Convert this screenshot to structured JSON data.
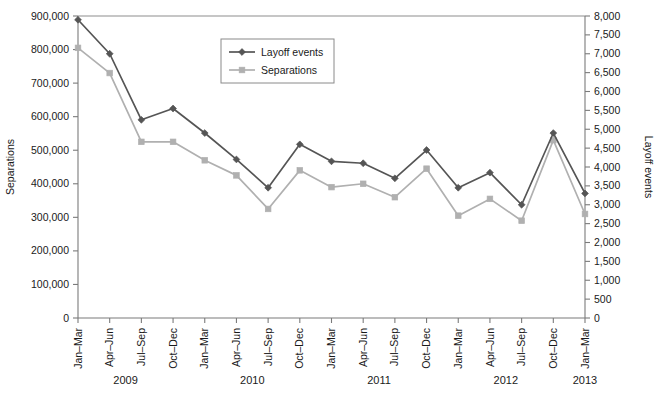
{
  "chart_data": {
    "type": "line",
    "title": "",
    "xlabel": "",
    "ylabel": "Separations",
    "y2label": "Layoff events",
    "grid": false,
    "legend_position": "top-center",
    "ylim": [
      0,
      900000
    ],
    "y2lim": [
      0,
      8000
    ],
    "ytick_labels": [
      "0",
      "100,000",
      "200,000",
      "300,000",
      "400,000",
      "500,000",
      "600,000",
      "700,000",
      "800,000",
      "900,000"
    ],
    "ytick_values": [
      0,
      100000,
      200000,
      300000,
      400000,
      500000,
      600000,
      700000,
      800000,
      900000
    ],
    "y2tick_labels": [
      "0",
      "500",
      "1,000",
      "1,500",
      "2,000",
      "2,500",
      "3,000",
      "3,500",
      "4,000",
      "4,500",
      "5,000",
      "5,500",
      "6,000",
      "6,500",
      "7,000",
      "7,500",
      "8,000"
    ],
    "y2tick_values": [
      0,
      500,
      1000,
      1500,
      2000,
      2500,
      3000,
      3500,
      4000,
      4500,
      5000,
      5500,
      6000,
      6500,
      7000,
      7500,
      8000
    ],
    "categories": [
      "Jan–Mar",
      "Apr–Jun",
      "Jul–Sep",
      "Oct–Dec",
      "Jan–Mar",
      "Apr–Jun",
      "Jul–Sep",
      "Oct–Dec",
      "Jan–Mar",
      "Apr–Jun",
      "Jul–Sep",
      "Oct–Dec",
      "Jan–Mar",
      "Apr–Jun",
      "Jul–Sep",
      "Oct–Dec",
      "Jan–Mar"
    ],
    "year_groups": [
      {
        "label": "2009",
        "start_index": 0,
        "end_index": 3
      },
      {
        "label": "2010",
        "start_index": 4,
        "end_index": 7
      },
      {
        "label": "2011",
        "start_index": 8,
        "end_index": 11
      },
      {
        "label": "2012",
        "start_index": 12,
        "end_index": 15
      },
      {
        "label": "2013",
        "start_index": 16,
        "end_index": 16
      }
    ],
    "series": [
      {
        "name": "Layoff events",
        "axis": "right",
        "color": "#555555",
        "marker": "diamond",
        "values": [
          7900,
          7000,
          5250,
          5550,
          4900,
          4200,
          3450,
          4600,
          4150,
          4100,
          3700,
          4450,
          3450,
          3850,
          3000,
          4900,
          3300
        ]
      },
      {
        "name": "Separations",
        "axis": "left",
        "color": "#b0b0b0",
        "marker": "square",
        "values": [
          805000,
          730000,
          525000,
          525000,
          470000,
          425000,
          325000,
          440000,
          390000,
          400000,
          360000,
          445000,
          305000,
          355000,
          290000,
          530000,
          310000
        ]
      }
    ],
    "legend": [
      {
        "label": "Layoff events",
        "color": "#555555",
        "marker": "diamond"
      },
      {
        "label": "Separations",
        "color": "#b0b0b0",
        "marker": "square"
      }
    ]
  }
}
